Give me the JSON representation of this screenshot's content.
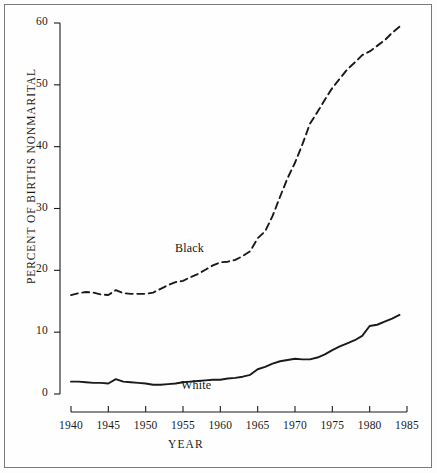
{
  "chart_data": {
    "type": "line",
    "title": "",
    "xlabel": "YEAR",
    "ylabel": "PERCENT OF BIRTHS  NONMARITAL",
    "xlim": [
      1940,
      1985
    ],
    "ylim": [
      0,
      60
    ],
    "xticks": [
      1940,
      1945,
      1950,
      1955,
      1960,
      1965,
      1970,
      1975,
      1980,
      1985
    ],
    "yticks": [
      0,
      10,
      20,
      30,
      40,
      50,
      60
    ],
    "grid": false,
    "legend_position": "inline-annotation",
    "annotations": [
      {
        "text": "Black",
        "x": 1957,
        "y": 23.5
      },
      {
        "text": "White",
        "x": 1958,
        "y": 1.6
      }
    ],
    "series": [
      {
        "name": "Black",
        "label": "Black",
        "style": "dashed",
        "color": "#1a1a1a",
        "x": [
          1940,
          1941,
          1942,
          1943,
          1944,
          1945,
          1946,
          1947,
          1948,
          1949,
          1950,
          1951,
          1952,
          1953,
          1954,
          1955,
          1956,
          1957,
          1958,
          1959,
          1960,
          1961,
          1962,
          1963,
          1964,
          1965,
          1966,
          1967,
          1968,
          1969,
          1970,
          1971,
          1972,
          1973,
          1974,
          1975,
          1976,
          1977,
          1978,
          1979,
          1980,
          1981,
          1982,
          1983,
          1984
        ],
        "values": [
          16.0,
          16.3,
          16.5,
          16.4,
          16.1,
          16.0,
          16.8,
          16.3,
          16.2,
          16.2,
          16.2,
          16.4,
          17.0,
          17.6,
          18.1,
          18.3,
          18.9,
          19.4,
          20.1,
          20.8,
          21.3,
          21.4,
          21.7,
          22.3,
          23.1,
          25.2,
          26.3,
          28.8,
          31.9,
          34.9,
          37.4,
          40.4,
          43.7,
          45.6,
          47.6,
          49.5,
          51.0,
          52.5,
          53.6,
          54.8,
          55.4,
          56.3,
          57.2,
          58.4,
          59.4
        ]
      },
      {
        "name": "White",
        "label": "White",
        "style": "solid",
        "color": "#1a1a1a",
        "x": [
          1940,
          1941,
          1942,
          1943,
          1944,
          1945,
          1946,
          1947,
          1948,
          1949,
          1950,
          1951,
          1952,
          1953,
          1954,
          1955,
          1956,
          1957,
          1958,
          1959,
          1960,
          1961,
          1962,
          1963,
          1964,
          1965,
          1966,
          1967,
          1968,
          1969,
          1970,
          1971,
          1972,
          1973,
          1974,
          1975,
          1976,
          1977,
          1978,
          1979,
          1980,
          1981,
          1982,
          1983,
          1984
        ],
        "values": [
          2.0,
          2.0,
          1.9,
          1.8,
          1.8,
          1.7,
          2.4,
          2.0,
          1.9,
          1.8,
          1.7,
          1.5,
          1.5,
          1.6,
          1.7,
          1.9,
          2.0,
          2.1,
          2.2,
          2.3,
          2.3,
          2.5,
          2.6,
          2.8,
          3.1,
          4.0,
          4.4,
          4.9,
          5.3,
          5.5,
          5.7,
          5.6,
          5.6,
          5.9,
          6.4,
          7.1,
          7.7,
          8.2,
          8.7,
          9.4,
          11.0,
          11.2,
          11.7,
          12.2,
          12.8
        ]
      }
    ]
  },
  "axes": {
    "y_label_text": "PERCENT OF BIRTHS  NONMARITAL",
    "x_label_text": "YEAR",
    "y_tick_labels": [
      "60",
      "50",
      "40",
      "30",
      "20",
      "10",
      "0"
    ],
    "x_tick_labels": [
      "1940",
      "1945",
      "1950",
      "1955",
      "1960",
      "1965",
      "1970",
      "1975",
      "1980",
      "1985"
    ]
  },
  "colors": {
    "ink": "#1a1a1a",
    "frame": "#7a7a7a",
    "background": "#fefefe"
  }
}
